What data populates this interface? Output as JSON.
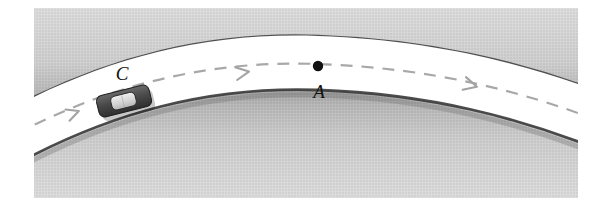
{
  "figure": {
    "domain": "diagram",
    "canvas": {
      "width": 606,
      "height": 203,
      "background": "#ffffff"
    }
  },
  "labels": {
    "car_label": "C",
    "point_label": "A"
  },
  "colors": {
    "background": "#ffffff",
    "road_surface": "#ffffff",
    "terrain_light": "#d9d9d9",
    "terrain_mid": "#c6c6c6",
    "terrain_dark": "#9a9a9a",
    "edge_shadow": "#3a3a3a",
    "centerline": "#a8a8a8",
    "arrow": "#a8a8a8",
    "car_body": "#4a4a4a",
    "car_cabin": "#d2d2d2",
    "point_marker": "#111111",
    "label_text": "#111111"
  },
  "elements": {
    "outer_terrain": {
      "name": "outer-terrain-region",
      "description": "Upper gray terrain outside the curve"
    },
    "inner_terrain": {
      "name": "inner-terrain-region",
      "description": "Lower gray terrain inside the curve"
    },
    "road": {
      "name": "road-surface",
      "description": "White curved road band between terrain regions",
      "width_px": 52
    },
    "centerline": {
      "name": "road-centerline",
      "style": "dashed",
      "dash_pattern": "12 9",
      "stroke_width": 2.2
    },
    "arrowheads": [
      {
        "name": "arrowhead-left",
        "x": 76,
        "y": 120,
        "angle": -14
      },
      {
        "name": "arrowhead-middle",
        "x": 248,
        "y": 76,
        "angle": -6
      },
      {
        "name": "arrowhead-right",
        "x": 478,
        "y": 88,
        "angle": 13
      }
    ],
    "car": {
      "name": "car-marker",
      "x": 124,
      "y": 102,
      "length": 54,
      "width": 23,
      "rotation_deg": -13
    },
    "point_a": {
      "name": "point-a-marker",
      "x": 318,
      "y": 74,
      "radius": 5
    }
  },
  "annotations": [
    {
      "name": "car-label",
      "text": "C",
      "x": 122,
      "y": 82
    },
    {
      "name": "point-a-label",
      "text": "A",
      "x": 320,
      "y": 105
    }
  ]
}
